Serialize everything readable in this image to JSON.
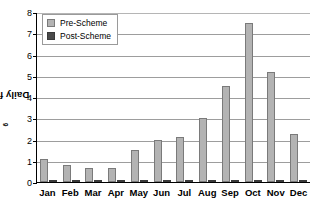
{
  "chart_data": {
    "type": "bar",
    "title": "",
    "subtitle": "",
    "xlabel": "",
    "ylabel": "Daily flow (10⁶ m³)",
    "ylabel_base": "Daily flow (10",
    "ylabel_exp": "6",
    "ylabel_tail": " m³)",
    "categories": [
      "Jan",
      "Feb",
      "Mar",
      "Apr",
      "May",
      "Jun",
      "Jul",
      "Aug",
      "Sep",
      "Oct",
      "Nov",
      "Dec"
    ],
    "series": [
      {
        "name": "Pre-Scheme",
        "color": "#b3b3b3",
        "values": [
          1.1,
          0.8,
          0.65,
          0.65,
          1.5,
          2.0,
          2.1,
          3.0,
          4.5,
          7.5,
          5.2,
          2.25
        ]
      },
      {
        "name": "Post-Scheme",
        "color": "#4a4a4a",
        "values": [
          0.06,
          0.06,
          0.06,
          0.06,
          0.06,
          0.06,
          0.06,
          0.06,
          0.06,
          0.06,
          0.06,
          0.06
        ]
      }
    ],
    "ylim": [
      0,
      8
    ],
    "yticks": [
      0,
      1,
      2,
      3,
      4,
      5,
      6,
      7,
      8
    ],
    "ytick_labels": [
      "0",
      "1",
      "2",
      "3",
      "4",
      "5",
      "6",
      "7",
      "8"
    ],
    "grid": true,
    "grid_axis": "y",
    "legend_position": "top-left",
    "legend_entries": [
      "Pre-Scheme",
      "Post-Scheme"
    ]
  },
  "legend": {
    "items": [
      {
        "label": "Pre-Scheme",
        "swatch": "legend-swatch-pre"
      },
      {
        "label": "Post-Scheme",
        "swatch": "legend-swatch-post"
      }
    ]
  },
  "colors": {
    "pre_fill": "#b3b3b3",
    "pre_edge": "#7a7a7a",
    "post_fill": "#4a4a4a",
    "post_edge": "#3a3a3a",
    "gridline": "#9d9d9d",
    "axis": "#000000",
    "background": "#ffffff"
  }
}
